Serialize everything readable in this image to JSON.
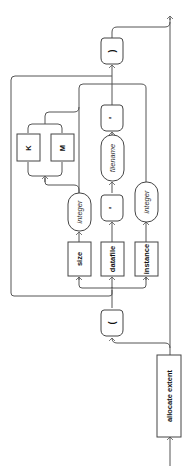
{
  "diagram": {
    "type": "railroad-syntax-diagram",
    "orientation": "rotated-90-ccw",
    "keyword": "allocate extent",
    "open_paren": "(",
    "close_paren": ")",
    "alternatives": [
      {
        "keyword": "size",
        "value": "integer",
        "units": [
          "K",
          "M"
        ]
      },
      {
        "keyword": "datafile",
        "separator": "'",
        "value": "filename",
        "separator_end": "'"
      },
      {
        "keyword": "instance",
        "value": "integer"
      }
    ],
    "labels": {
      "allocate_extent": "allocate extent",
      "lparen": "(",
      "rparen": ")",
      "size": "size",
      "datafile": "datafile",
      "instance": "instance",
      "integer_size": "integer",
      "integer_instance": "integer",
      "filename": "filename",
      "quote_open": "'",
      "quote_close": "'",
      "unit_k": "K",
      "unit_m": "M"
    },
    "colors": {
      "line": "#555555",
      "text": "#111111",
      "background": "#ffffff"
    }
  }
}
